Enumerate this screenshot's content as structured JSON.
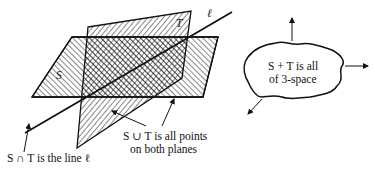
{
  "diagram": {
    "plane_s_label": "S",
    "plane_t_label": "T",
    "line_label": "ℓ",
    "intersection_caption": "S ∩ T is the line ℓ",
    "union_caption_line1": "S ∪ T is all points",
    "union_caption_line2": "on both planes",
    "sum_caption_line1": "S + T is all",
    "sum_caption_line2": "of 3-space",
    "colors": {
      "ink": "#111111",
      "background": "#ffffff"
    }
  }
}
